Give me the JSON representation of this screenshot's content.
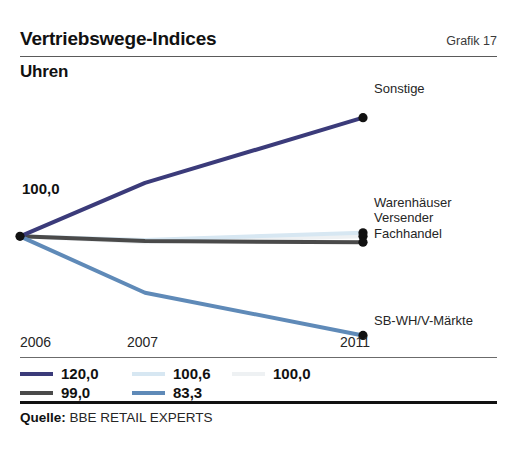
{
  "header": {
    "title": "Vertriebswege-Indices",
    "graphic_number": "Grafik 17",
    "subtitle": "Uhren"
  },
  "source": {
    "label": "Quelle:",
    "text": "BBE RETAIL EXPERTS"
  },
  "origin_value_label": "100,0",
  "point_labels": {
    "sonstige": "Sonstige",
    "warenhaeuser": "Warenhäuser",
    "versender": "Versender",
    "fachhandel": "Fachhandel",
    "sbwh": "SB-WH/V-Märkte"
  },
  "legend": [
    {
      "label": "120,0",
      "color": "#3b3b7a"
    },
    {
      "label": "100,6",
      "color": "#d7e7f2"
    },
    {
      "label": "100,0",
      "color": "#eef1f3"
    },
    {
      "label": "99,0",
      "color": "#4a4a4a"
    },
    {
      "label": "83,3",
      "color": "#5f8ab8"
    }
  ],
  "chart_data": {
    "type": "line",
    "title": "Vertriebswege-Indices",
    "subtitle": "Uhren",
    "xlabel": "",
    "ylabel": "Index (2006 = 100,0)",
    "grid": false,
    "legend_position": "bottom",
    "x": [
      2006,
      2007,
      2011
    ],
    "tick_labels": [
      "2006",
      "2007",
      "2011"
    ],
    "base_value": 100.0,
    "ylim": [
      80,
      125
    ],
    "series": [
      {
        "name": "Sonstige",
        "color": "#3b3b7a",
        "end_label": "120,0",
        "values": [
          100.0,
          109.0,
          120.0
        ]
      },
      {
        "name": "Warenhäuser",
        "color": "#d7e7f2",
        "end_label": "100,6",
        "values": [
          100.0,
          99.4,
          100.6
        ]
      },
      {
        "name": "Versender",
        "color": "#eef1f3",
        "end_label": "100,0",
        "values": [
          100.0,
          99.0,
          100.0
        ]
      },
      {
        "name": "Fachhandel",
        "color": "#4a4a4a",
        "end_label": "99,0",
        "values": [
          100.0,
          99.2,
          99.0
        ]
      },
      {
        "name": "SB-WH/V-Märkte",
        "color": "#5f8ab8",
        "end_label": "83,3",
        "values": [
          100.0,
          90.5,
          83.3
        ]
      }
    ]
  }
}
